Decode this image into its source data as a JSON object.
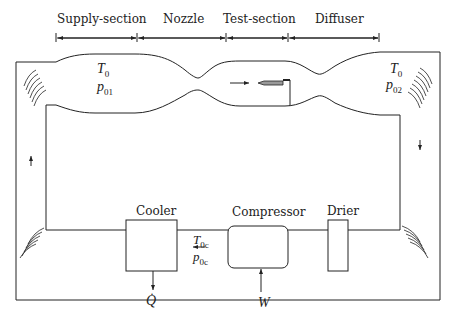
{
  "diagram": {
    "type": "closed-circuit wind tunnel schematic",
    "sections": [
      {
        "label": "Supply-section"
      },
      {
        "label": "Nozzle"
      },
      {
        "label": "Test-section"
      },
      {
        "label": "Diffuser"
      }
    ],
    "components": [
      {
        "label": "Cooler"
      },
      {
        "label": "Compressor"
      },
      {
        "label": "Drier"
      }
    ],
    "symbols": {
      "supply_T": "T",
      "supply_T_sub": "0",
      "supply_p": "p",
      "supply_p_sub": "01",
      "diffuser_T": "T",
      "diffuser_T_sub": "0",
      "diffuser_p": "p",
      "diffuser_p_sub": "02",
      "return_T": "T",
      "return_T_sub": "0c",
      "return_p": "p",
      "return_p_sub": "0c",
      "heat": "Q̇",
      "work": "W"
    },
    "colors": {
      "line": "#222222",
      "model_fill": "#999999",
      "background": "#ffffff"
    }
  }
}
